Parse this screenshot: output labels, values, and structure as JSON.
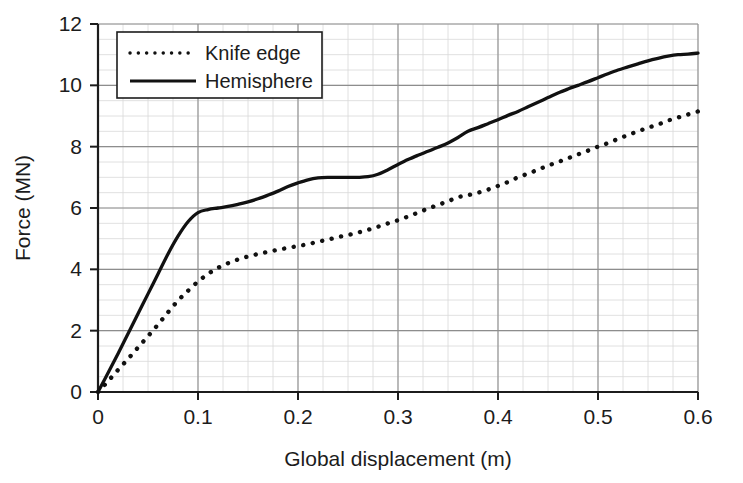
{
  "chart_data": {
    "type": "line",
    "title": "",
    "xlabel": "Global displacement (m)",
    "ylabel": "Force (MN)",
    "xlim": [
      0,
      0.6
    ],
    "ylim": [
      0,
      12
    ],
    "xticks": [
      0,
      0.1,
      0.2,
      0.3,
      0.4,
      0.5,
      0.6
    ],
    "xtick_labels": [
      "0",
      "0.1",
      "0.2",
      "0.3",
      "0.4",
      "0.5",
      "0.6"
    ],
    "yticks": [
      0,
      2,
      4,
      6,
      8,
      10,
      12
    ],
    "ytick_labels": [
      "0",
      "2",
      "4",
      "6",
      "8",
      "10",
      "12"
    ],
    "grid": true,
    "grid_minor": true,
    "grid_minor_x_step": 0.025,
    "grid_minor_y_step": 0.5,
    "legend_position": "upper-left-inside",
    "series": [
      {
        "name": "Knife edge",
        "style": "dotted",
        "color": "#111111",
        "x": [
          0.0,
          0.01,
          0.02,
          0.03,
          0.04,
          0.05,
          0.06,
          0.07,
          0.08,
          0.09,
          0.1,
          0.11,
          0.12,
          0.13,
          0.14,
          0.15,
          0.16,
          0.17,
          0.18,
          0.19,
          0.2,
          0.21,
          0.22,
          0.23,
          0.24,
          0.25,
          0.26,
          0.27,
          0.28,
          0.29,
          0.3,
          0.31,
          0.32,
          0.33,
          0.34,
          0.35,
          0.36,
          0.37,
          0.38,
          0.39,
          0.4,
          0.41,
          0.42,
          0.43,
          0.44,
          0.45,
          0.46,
          0.47,
          0.48,
          0.49,
          0.5,
          0.51,
          0.52,
          0.53,
          0.54,
          0.55,
          0.56,
          0.57,
          0.58,
          0.59,
          0.6
        ],
        "y": [
          0.0,
          0.35,
          0.72,
          1.08,
          1.45,
          1.82,
          2.2,
          2.6,
          2.98,
          3.3,
          3.6,
          3.85,
          4.05,
          4.2,
          4.32,
          4.42,
          4.5,
          4.57,
          4.64,
          4.7,
          4.76,
          4.82,
          4.9,
          4.97,
          5.05,
          5.12,
          5.2,
          5.29,
          5.39,
          5.5,
          5.6,
          5.72,
          5.85,
          5.98,
          6.1,
          6.22,
          6.35,
          6.42,
          6.5,
          6.6,
          6.72,
          6.85,
          7.0,
          7.12,
          7.25,
          7.38,
          7.5,
          7.62,
          7.75,
          7.87,
          8.0,
          8.12,
          8.25,
          8.38,
          8.5,
          8.62,
          8.72,
          8.85,
          8.95,
          9.05,
          9.15
        ]
      },
      {
        "name": "Hemisphere",
        "style": "solid",
        "color": "#111111",
        "x": [
          0.0,
          0.01,
          0.02,
          0.03,
          0.04,
          0.05,
          0.06,
          0.07,
          0.08,
          0.09,
          0.1,
          0.11,
          0.12,
          0.13,
          0.14,
          0.15,
          0.16,
          0.17,
          0.18,
          0.19,
          0.2,
          0.21,
          0.22,
          0.23,
          0.24,
          0.25,
          0.26,
          0.27,
          0.28,
          0.29,
          0.3,
          0.31,
          0.32,
          0.33,
          0.34,
          0.35,
          0.36,
          0.37,
          0.38,
          0.39,
          0.4,
          0.41,
          0.42,
          0.43,
          0.44,
          0.45,
          0.46,
          0.47,
          0.48,
          0.49,
          0.5,
          0.51,
          0.52,
          0.53,
          0.54,
          0.55,
          0.56,
          0.57,
          0.58,
          0.59,
          0.6
        ],
        "y": [
          0.0,
          0.62,
          1.25,
          1.9,
          2.55,
          3.2,
          3.85,
          4.5,
          5.08,
          5.55,
          5.85,
          5.95,
          6.0,
          6.05,
          6.12,
          6.2,
          6.3,
          6.42,
          6.55,
          6.7,
          6.82,
          6.92,
          6.98,
          7.0,
          7.0,
          7.0,
          7.0,
          7.02,
          7.1,
          7.25,
          7.42,
          7.58,
          7.72,
          7.85,
          7.98,
          8.12,
          8.3,
          8.5,
          8.62,
          8.75,
          8.88,
          9.02,
          9.15,
          9.3,
          9.45,
          9.6,
          9.75,
          9.88,
          10.0,
          10.12,
          10.25,
          10.38,
          10.5,
          10.6,
          10.7,
          10.8,
          10.88,
          10.95,
          11.0,
          11.02,
          11.05
        ]
      }
    ]
  },
  "legend": {
    "entries": [
      {
        "label": "Knife edge"
      },
      {
        "label": "Hemisphere"
      }
    ]
  },
  "colors": {
    "axis": "#1c1c1c",
    "grid_major": "#8d8d8d",
    "grid_minor": "#d8d8d8",
    "curve": "#111111",
    "background": "#ffffff"
  }
}
